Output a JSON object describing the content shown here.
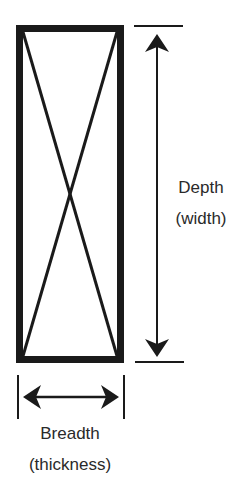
{
  "diagram": {
    "colors": {
      "stroke": "#1a1a1a",
      "text": "#2a2a2a",
      "background": "#ffffff"
    },
    "cross_section": {
      "shape": "rectangle-with-x",
      "description": "Rectangular cross-section with diagonal cross lines"
    },
    "depth_dimension": {
      "line1": "Depth",
      "line2": "(width)",
      "orientation": "vertical",
      "arrow": "double-headed"
    },
    "breadth_dimension": {
      "line1": "Breadth",
      "line2": "(thickness)",
      "orientation": "horizontal",
      "arrow": "double-headed"
    }
  }
}
